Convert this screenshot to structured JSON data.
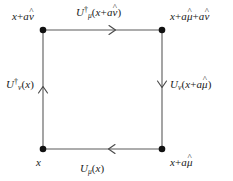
{
  "figure": {
    "type": "lattice-plaquette-diagram",
    "background_color": "#ffffff",
    "line_color": "#555555",
    "vertex_color": "#000000",
    "text_color": "#1a1a1a"
  },
  "geometry": {
    "square": {
      "left_x": 43,
      "right_x": 162,
      "top_y": 30,
      "bottom_y": 149
    },
    "vertices": [
      {
        "name": "top-left",
        "x": 43,
        "y": 30
      },
      {
        "name": "top-right",
        "x": 162,
        "y": 30
      },
      {
        "name": "bottom-left",
        "x": 43,
        "y": 149
      },
      {
        "name": "bottom-right",
        "x": 162,
        "y": 149
      }
    ],
    "vertex_radius": 3.2
  },
  "corners": {
    "top_left": {
      "base": "x",
      "plus": "+",
      "term1": "a",
      "hat1": "ν"
    },
    "top_right": {
      "base": "x",
      "plus": "+",
      "term1": "a",
      "hat1": "μ",
      "plus2": "+",
      "term2": "a",
      "hat2": "ν"
    },
    "bottom_left": {
      "base": "x"
    },
    "bottom_right": {
      "base": "x",
      "plus": "+",
      "term1": "a",
      "hat1": "μ"
    }
  },
  "edges": [
    {
      "name": "top-edge",
      "symbol": "U",
      "dagger": "†",
      "subscript": "μ",
      "arg_open": "(",
      "arg_base": "x",
      "arg_plus": "+",
      "arg_coeff": "a",
      "arg_hat": "ν",
      "arg_close": ")",
      "direction": "right",
      "arrow_x": 114,
      "arrow_y": 30
    },
    {
      "name": "right-edge",
      "symbol": "U",
      "dagger": "",
      "subscript": "ν",
      "arg_open": "(",
      "arg_base": "x",
      "arg_plus": "+",
      "arg_coeff": "a",
      "arg_hat": "μ",
      "arg_close": ")",
      "direction": "down",
      "arrow_x": 162,
      "arrow_y": 86
    },
    {
      "name": "bottom-edge",
      "symbol": "U",
      "dagger": "",
      "subscript": "μ",
      "arg_open": "(",
      "arg_base": "x",
      "arg_close": ")",
      "direction": "left",
      "arrow_x": 110,
      "arrow_y": 149
    },
    {
      "name": "left-edge",
      "symbol": "U",
      "dagger": "†",
      "subscript": "ν",
      "arg_open": "(",
      "arg_base": "x",
      "arg_close": ")",
      "direction": "up",
      "arrow_x": 43,
      "arrow_y": 88
    }
  ],
  "hat_glyph": "^"
}
